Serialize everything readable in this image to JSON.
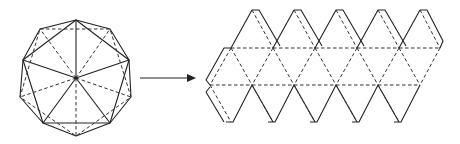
{
  "diagram": {
    "type": "icosahedron-to-net",
    "left_figure": "icosahedron-top-view",
    "connector": "arrow-right",
    "right_figure": "icosahedron-net-with-tabs",
    "net": {
      "top_row_triangles": 5,
      "middle_band_triangles": 10,
      "bottom_row_triangles": 5
    },
    "colors": {
      "line": "#222222",
      "background": "#ffffff"
    }
  }
}
